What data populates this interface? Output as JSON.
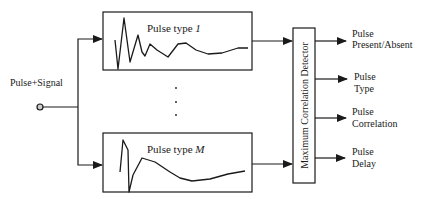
{
  "diagram": {
    "input_label": "Pulse+Signal",
    "filters": [
      {
        "label_prefix": "Pulse type ",
        "label_index": "1"
      },
      {
        "label_prefix": "Pulse type ",
        "label_index": "M"
      }
    ],
    "ellipsis": "⋮",
    "detector_label": "Maximum Correlation Detector",
    "outputs": [
      {
        "line1": "Pulse",
        "line2": "Present/Absent"
      },
      {
        "line1": "Pulse",
        "line2": "Type"
      },
      {
        "line1": "Pulse",
        "line2": "Correlation"
      },
      {
        "line1": "Pulse",
        "line2": "Delay"
      }
    ]
  }
}
